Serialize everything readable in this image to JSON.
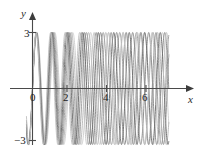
{
  "figure": {
    "kind": "math-graph",
    "background_color": "#ffffff"
  },
  "axes": {
    "x_axis_label": "x",
    "y_axis_label": "y",
    "axis_color": "#4a4a4a",
    "tick_labels": {
      "y_top": "3",
      "y_bottom": "−3",
      "x_origin": "0",
      "x_two": "2",
      "x_four": "4",
      "x_six": "6"
    }
  },
  "chart_data": {
    "type": "line",
    "title": "",
    "xlabel": "x",
    "ylabel": "y",
    "xlim": [
      -0.35,
      7.9
    ],
    "ylim": [
      -3.6,
      3.6
    ],
    "xticks": [
      0,
      2,
      4,
      6
    ],
    "yticks": [
      -3,
      3
    ],
    "grid": false,
    "legend": false,
    "amplitude": 3,
    "series": [
      {
        "name": "curve-1",
        "color": "#cfcfcf",
        "amplitude": 3,
        "omega": 6.05,
        "phase": 0.0
      },
      {
        "name": "curve-2",
        "color": "#b9b9b9",
        "amplitude": 3,
        "omega": 6.28,
        "phase": 0.0
      },
      {
        "name": "curve-3",
        "color": "#a0a0a0",
        "amplitude": 3,
        "omega": 6.52,
        "phase": 0.0
      },
      {
        "name": "curve-4",
        "color": "#8a8a8a",
        "amplitude": 3,
        "omega": 6.76,
        "phase": 0.0
      },
      {
        "name": "curve-5",
        "color": "#6f6f6f",
        "amplitude": 3,
        "omega": 7.0,
        "phase": 0.0
      },
      {
        "name": "curve-6",
        "color": "#949494",
        "amplitude": 3,
        "omega": 7.24,
        "phase": 0.0
      },
      {
        "name": "curve-7",
        "color": "#c4c4c4",
        "amplitude": 3,
        "omega": 7.48,
        "phase": 0.0
      }
    ]
  }
}
